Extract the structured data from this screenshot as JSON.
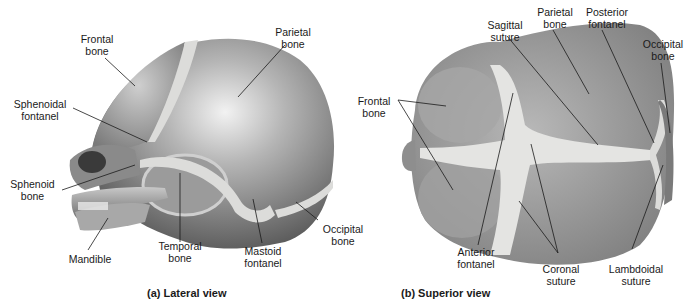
{
  "figure": {
    "panels": [
      {
        "id": "a",
        "caption": "(a) Lateral view",
        "labels": {
          "frontal_bone": "Frontal\nbone",
          "parietal_bone": "Parietal\nbone",
          "sphenoidal_fontanel": "Sphenoidal\nfontanel",
          "sphenoid_bone": "Sphenoid\nbone",
          "mandible": "Mandible",
          "temporal_bone": "Temporal\nbone",
          "mastoid_fontanel": "Mastoid\nfontanel",
          "occipital_bone": "Occipital\nbone"
        }
      },
      {
        "id": "b",
        "caption": "(b) Superior view",
        "labels": {
          "frontal_bone": "Frontal\nbone",
          "sagittal_suture": "Sagittal\nsuture",
          "parietal_bone": "Parietal\nbone",
          "posterior_fontanel": "Posterior\nfontanel",
          "occipital_bone": "Occipital\nbone",
          "anterior_fontanel": "Anterior\nfontanel",
          "coronal_suture": "Coronal\nsuture",
          "lambdoidal_suture": "Lambdoidal\nsuture"
        }
      }
    ],
    "colors": {
      "bone_dark": "#6f6f6f",
      "bone_mid": "#9a9a9a",
      "bone_light": "#d6d6d6",
      "suture": "#e4e4e2",
      "leader": "#1a1a1a"
    }
  }
}
